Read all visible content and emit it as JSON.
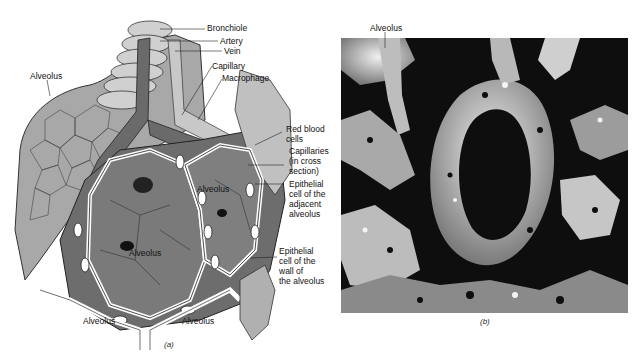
{
  "figure": {
    "panel_a": {
      "caption": "(a)",
      "labels": {
        "bronchiole": "Bronchiole",
        "artery": "Artery",
        "vein": "Vein",
        "capillary": "Capillary",
        "macrophage": "Macrophage",
        "alveolus_top_left": "Alveolus",
        "red_blood_cells": "Red blood\ncells",
        "capillaries_cross_section": "Capillaries\n(in cross\nsection)",
        "epithelial_adjacent": "Epithelial\ncell of the\nadjacent\nalveolus",
        "epithelial_wall": "Epithelial\ncell of the\nwall of\nthe alveolus",
        "alveolus_center_right": "Alveolus",
        "alveolus_center": "Alveolus",
        "alveolus_bottom_left": "Alveolus",
        "alveolus_bottom_right": "Alveolus"
      }
    },
    "panel_b": {
      "caption": "(b)",
      "labels": {
        "alveolus_top": "Alveolus"
      }
    },
    "colors": {
      "background": "#ffffff",
      "dark_tissue": "#5a5a5a",
      "mid_tissue": "#8c8c8c",
      "light_tissue": "#c4c4c4",
      "vessel": "#6e6e6e",
      "micrograph_dark": "#0e0e0e",
      "micrograph_light": "#d8d8d8"
    }
  }
}
